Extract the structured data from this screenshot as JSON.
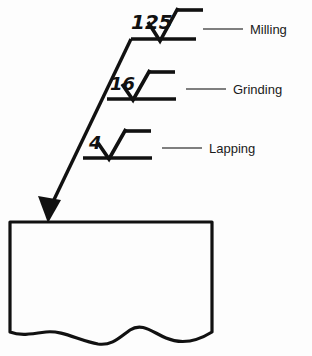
{
  "figure": {
    "background_color": "#fdfdfd",
    "ink_color": "#111111",
    "leader_color": "#555555"
  },
  "callouts": [
    {
      "roughness": "125",
      "process": "Milling",
      "symbol_name": "surface-finish-symbol-125",
      "num_x": 160,
      "num_y": 27,
      "num_size": 19,
      "check_x": 148,
      "check_y": 41,
      "shelf_x1": 131,
      "shelf_x2": 196,
      "shelf_y": 39,
      "bar_x1": 160,
      "bar_x2": 190,
      "bar_y": 12,
      "leader_x1": 203,
      "leader_x2": 243,
      "leader_y": 29,
      "label_x": 250,
      "label_y": 34,
      "label_size": 12
    },
    {
      "roughness": "16",
      "process": "Grinding",
      "symbol_name": "surface-finish-symbol-16",
      "num_x": 118,
      "num_y": 87,
      "num_size": 17,
      "check_x": 113,
      "check_y": 100,
      "shelf_x1": 107,
      "shelf_x2": 176,
      "shelf_y": 99,
      "bar_x1": 131,
      "bar_x2": 162,
      "bar_y": 72,
      "leader_x1": 186,
      "leader_x2": 226,
      "leader_y": 89,
      "label_x": 233,
      "label_y": 94,
      "label_size": 12
    },
    {
      "roughness": "4",
      "process": "Lapping",
      "symbol_name": "surface-finish-symbol-4",
      "num_x": 95,
      "num_y": 145,
      "num_size": 17,
      "check_x": 89,
      "check_y": 159,
      "shelf_x1": 83,
      "shelf_x2": 152,
      "shelf_y": 158,
      "bar_x1": 107,
      "bar_x2": 138,
      "bar_y": 131,
      "leader_x1": 162,
      "leader_x2": 202,
      "leader_y": 148,
      "label_x": 209,
      "label_y": 153,
      "label_size": 12
    }
  ],
  "leader": {
    "name": "main-leader-line",
    "from_x": 131,
    "from_y": 39,
    "to_x": 48,
    "to_y": 212,
    "arrow_tip_x": 48,
    "arrow_tip_y": 222
  },
  "workpiece": {
    "name": "workpiece-body",
    "left": 10,
    "right": 212,
    "top": 222,
    "bottom": 338,
    "break_line_y": 332
  }
}
